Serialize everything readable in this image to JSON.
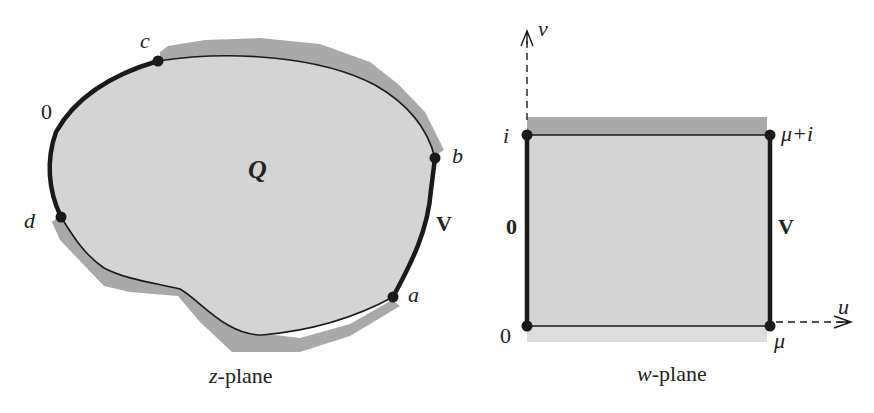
{
  "colors": {
    "region_fill": "#d4d4d4",
    "boundary_shade": "#a9a9a9",
    "curve": "#1a1a1a",
    "background": "#ffffff"
  },
  "z_plane": {
    "caption_italic": "z",
    "caption_rest": "-plane",
    "region_label": "Q",
    "points": {
      "a": "a",
      "b": "b",
      "c": "c",
      "d": "d"
    },
    "arc_labels": {
      "dc_arc": "0",
      "ab_arc": "V"
    }
  },
  "w_plane": {
    "caption_italic": "w",
    "caption_rest": "-plane",
    "axes": {
      "horizontal": "u",
      "vertical": "v"
    },
    "corners": {
      "origin": "0",
      "top_left": "i",
      "top_right": "μ+i",
      "bottom_right": "μ"
    },
    "side_labels": {
      "left": "0",
      "right": "V"
    }
  }
}
